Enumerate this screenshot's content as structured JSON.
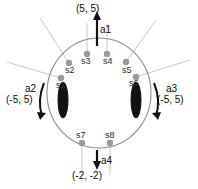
{
  "diagram": {
    "body_shape": "circle",
    "colors": {
      "body_outline": "#8d8d8d",
      "sensor_dot": "#9a9a9a",
      "sensor_ray": "#c9c9c9",
      "actuator_arrow": "#111111",
      "wheel": "#111111",
      "background": "#ffffff"
    },
    "sensors": [
      {
        "id": "s1",
        "label": "s1"
      },
      {
        "id": "s2",
        "label": "s2"
      },
      {
        "id": "s3",
        "label": "s3"
      },
      {
        "id": "s4",
        "label": "s4"
      },
      {
        "id": "s5",
        "label": "s5"
      },
      {
        "id": "s6",
        "label": "s6"
      },
      {
        "id": "s7",
        "label": "s7"
      },
      {
        "id": "s8",
        "label": "s8"
      }
    ],
    "actuators": [
      {
        "id": "a1",
        "label": "a1",
        "value": "(5, 5)",
        "kind": "arrow-up",
        "position": "top"
      },
      {
        "id": "a2",
        "label": "a2",
        "value": "(-5, 5)",
        "kind": "arc-left",
        "position": "left"
      },
      {
        "id": "a3",
        "label": "a3",
        "value": "(-5, 5)",
        "kind": "arc-right",
        "position": "right"
      },
      {
        "id": "a4",
        "label": "a4",
        "value": "(-2, -2)",
        "kind": "arrow-down",
        "position": "bottom"
      }
    ],
    "wheels": [
      {
        "id": "wheel-left",
        "side": "left"
      },
      {
        "id": "wheel-right",
        "side": "right"
      }
    ]
  }
}
